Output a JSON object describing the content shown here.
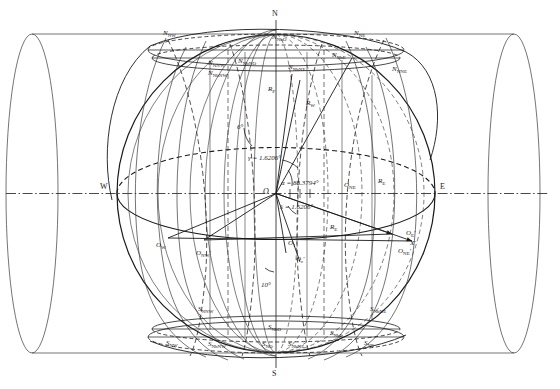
{
  "figure": {
    "cardinal_points": {
      "north": "N",
      "south": "S",
      "east": "E",
      "west": "W"
    },
    "angles": [
      {
        "id": "gamma",
        "label": "γ = 1.6206°",
        "value": 1.6206,
        "unit": "deg"
      },
      {
        "id": "alpha",
        "label": "α = 88.3794°",
        "value": 88.3794,
        "unit": "deg"
      },
      {
        "id": "lambda",
        "label": "λ = 1.6206°",
        "value": 1.6206,
        "unit": "deg"
      },
      {
        "id": "six",
        "label": "6°",
        "value": 6,
        "unit": "deg"
      },
      {
        "id": "ten",
        "label": "10°",
        "value": 10,
        "unit": "deg"
      }
    ],
    "radii": [
      {
        "id": "Rp",
        "base": "R",
        "sub": "P"
      },
      {
        "id": "Rw",
        "base": "R",
        "sub": "W"
      },
      {
        "id": "Re_upper",
        "base": "R",
        "sub": "E"
      },
      {
        "id": "Re_lower",
        "base": "R",
        "sub": "E"
      }
    ],
    "center_label": {
      "base": "O",
      "sub": ""
    },
    "north_labels": [
      {
        "id": "n-nw",
        "base": "N",
        "sub": "NW"
      },
      {
        "id": "n-nnw",
        "base": "N",
        "sub": "NNW"
      },
      {
        "id": "n-nbw",
        "base": "N",
        "sub": "NbW"
      },
      {
        "id": "n-nbo",
        "base": "N",
        "sub": "NbO"
      },
      {
        "id": "n-nbno",
        "base": "N",
        "sub": "NbNO"
      },
      {
        "id": "n-nbne",
        "base": "N",
        "sub": "NbNE"
      },
      {
        "id": "n-nbe",
        "base": "N",
        "sub": "NbE"
      },
      {
        "id": "n-ne",
        "base": "N",
        "sub": "NE"
      },
      {
        "id": "n-nne",
        "base": "N",
        "sub": "NNE"
      }
    ],
    "south_labels": [
      {
        "id": "s-nw",
        "base": "S",
        "sub": "NW"
      },
      {
        "id": "s-nnw",
        "base": "S",
        "sub": "NNW"
      },
      {
        "id": "s-nbw",
        "base": "S",
        "sub": "NbW"
      },
      {
        "id": "s-nbo",
        "base": "S",
        "sub": "NbO"
      },
      {
        "id": "s-nbno",
        "base": "S",
        "sub": "NbNO"
      },
      {
        "id": "s-nbne",
        "base": "S",
        "sub": "NbNE"
      },
      {
        "id": "s-nbe",
        "base": "S",
        "sub": "NbE"
      },
      {
        "id": "s-ne",
        "base": "S",
        "sub": "NE"
      }
    ],
    "orbit_labels": [
      {
        "id": "o-w",
        "base": "O",
        "sub": "W",
        "prime": false
      },
      {
        "id": "o-nw",
        "base": "O",
        "sub": "NW",
        "prime": true
      },
      {
        "id": "o-nw2",
        "base": "O",
        "sub": "NW",
        "prime": true
      },
      {
        "id": "o-ne",
        "base": "O",
        "sub": "NE",
        "prime": false
      },
      {
        "id": "o-ne2",
        "base": "O",
        "sub": "NE",
        "prime": true
      },
      {
        "id": "o-e",
        "base": "O",
        "sub": "E",
        "prime": true
      },
      {
        "id": "o-1",
        "base": "O",
        "sub": "1",
        "prime": false
      },
      {
        "id": "o-c",
        "base": "O",
        "sub": "c",
        "prime": true
      }
    ],
    "axis_labels": [
      {
        "id": "x-prime",
        "base": "X",
        "prime": true
      }
    ],
    "colors": {
      "line": "#1a1a1a",
      "thin": "#555555",
      "background": "#ffffff"
    }
  }
}
